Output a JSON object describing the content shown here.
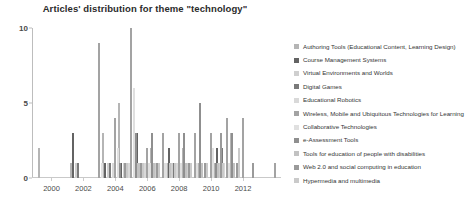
{
  "chart_data": {
    "type": "bar",
    "title": "Articles' distribution for theme \"technology\"",
    "xlabel": "",
    "ylabel": "",
    "ylim": [
      0,
      10
    ],
    "yticks": [
      0,
      5,
      10
    ],
    "grid": false,
    "legend_position": "right",
    "categories": [
      "2000",
      "2001",
      "2002",
      "2003",
      "2004",
      "2005",
      "2006",
      "2007",
      "2008",
      "2009",
      "2010",
      "2011",
      "2012",
      "2013",
      "2014"
    ],
    "xtick_labels": [
      "2000",
      "2002",
      "2004",
      "2006",
      "2008",
      "2010",
      "2012"
    ],
    "series": [
      {
        "name": "Authoring Tools (Educational Content, Learning Design)",
        "color": "#b5b5b5",
        "values": [
          2,
          0,
          1,
          0,
          3,
          5,
          1,
          2,
          1,
          2,
          1,
          1,
          3,
          0,
          0
        ]
      },
      {
        "name": "Course Management Systems",
        "color": "#636363",
        "values": [
          0,
          0,
          3,
          0,
          1,
          1,
          3,
          0,
          2,
          0,
          0,
          2,
          1,
          0,
          0
        ]
      },
      {
        "name": "Virtual Environments and Worlds",
        "color": "#cfcfcf",
        "values": [
          0,
          0,
          1,
          0,
          1,
          1,
          0,
          1,
          1,
          1,
          0,
          1,
          0,
          0,
          0
        ]
      },
      {
        "name": "Digital Games",
        "color": "#7a7a7a",
        "values": [
          0,
          0,
          1,
          0,
          1,
          1,
          1,
          0,
          1,
          1,
          0,
          2,
          1,
          0,
          0
        ]
      },
      {
        "name": "Educational Robotics",
        "color": "#d9d9d9",
        "values": [
          0,
          0,
          0,
          0,
          1,
          1,
          1,
          0,
          1,
          0,
          0,
          1,
          0,
          0,
          0
        ]
      },
      {
        "name": "Wireless, Mobile and Ubiquitous Technologies for Learning",
        "color": "#a3a3a3",
        "values": [
          0,
          0,
          0,
          9,
          4,
          10,
          2,
          3,
          3,
          3,
          3,
          4,
          4,
          0,
          1
        ]
      },
      {
        "name": "Collaborative Technologies",
        "color": "#e0e0e0",
        "values": [
          0,
          0,
          0,
          1,
          2,
          6,
          1,
          1,
          1,
          1,
          2,
          1,
          0,
          0,
          0
        ]
      },
      {
        "name": "e-Assessment Tools",
        "color": "#8f8f8f",
        "values": [
          0,
          0,
          0,
          0,
          1,
          3,
          3,
          0,
          3,
          5,
          1,
          3,
          0,
          0,
          0
        ]
      },
      {
        "name": "Tools for education of people with disabilities",
        "color": "#c2c2c2",
        "values": [
          0,
          0,
          0,
          0,
          0,
          1,
          1,
          1,
          1,
          1,
          1,
          1,
          0,
          0,
          0
        ]
      },
      {
        "name": "Web 2.0 and social computing in education",
        "color": "#9a9a9a",
        "values": [
          0,
          0,
          0,
          0,
          1,
          1,
          1,
          0,
          1,
          1,
          3,
          1,
          1,
          0,
          0
        ]
      },
      {
        "name": "Hypermedia and multimedia",
        "color": "#cacaca",
        "values": [
          0,
          0,
          0,
          0,
          1,
          1,
          1,
          1,
          1,
          1,
          1,
          2,
          0,
          0,
          0
        ]
      }
    ]
  }
}
